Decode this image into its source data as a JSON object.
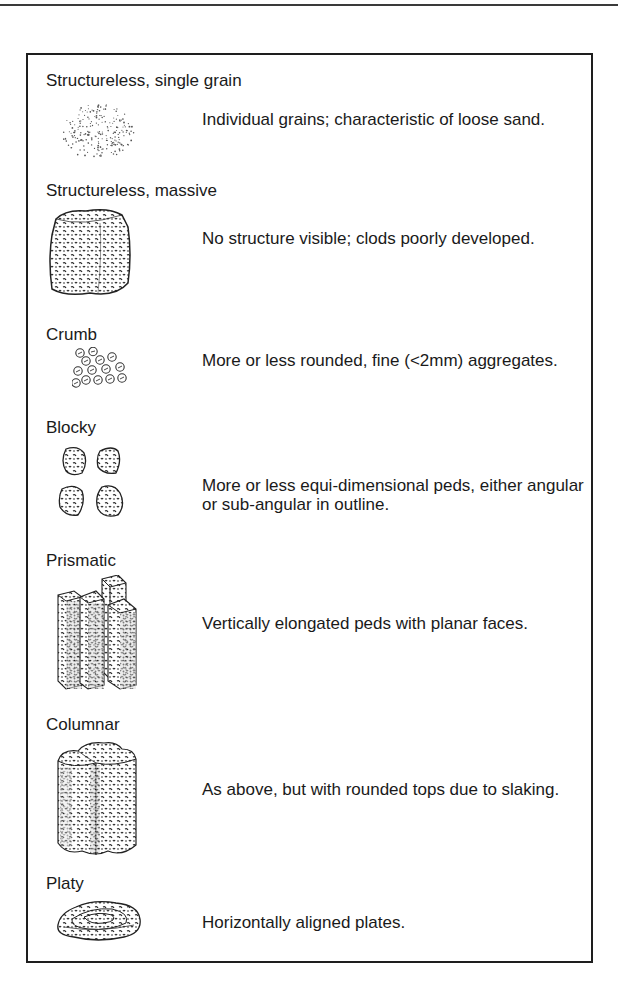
{
  "document": {
    "title": "Soil structure types",
    "entries": [
      {
        "label": "Structureless, single grain",
        "description": "Individual grains; characteristic of loose sand.",
        "illustration": "single-grain-dots-icon"
      },
      {
        "label": "Structureless, massive",
        "description": "No structure visible; clods poorly developed.",
        "illustration": "massive-clod-icon"
      },
      {
        "label": "Crumb",
        "description": "More or less rounded, fine (<2mm) aggregates.",
        "illustration": "crumb-aggregates-icon"
      },
      {
        "label": "Blocky",
        "description": "More or less equi-dimensional peds, either angular or sub-angular in outline.",
        "illustration": "blocky-peds-icon"
      },
      {
        "label": "Prismatic",
        "description": "Vertically elongated peds with planar faces.",
        "illustration": "prismatic-peds-icon"
      },
      {
        "label": "Columnar",
        "description": "As above, but with rounded tops due to slaking.",
        "illustration": "columnar-peds-icon"
      },
      {
        "label": "Platy",
        "description": "Horizontally aligned plates.",
        "illustration": "platy-plates-icon"
      }
    ]
  },
  "colors": {
    "ink": "#1a1a1a",
    "border": "#1e1e1e",
    "background": "#ffffff"
  }
}
